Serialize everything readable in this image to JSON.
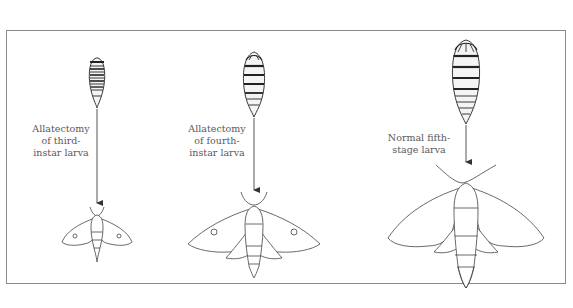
{
  "figure": {
    "clipped_caption": "",
    "panels": [
      {
        "id": "third-instar",
        "label_lines": [
          "Allatectomy",
          "of third-",
          "instar larva"
        ],
        "larva_size": "small",
        "moth_size": "small"
      },
      {
        "id": "fourth-instar",
        "label_lines": [
          "Allatectomy",
          "of fourth-",
          "instar larva"
        ],
        "larva_size": "medium",
        "moth_size": "medium"
      },
      {
        "id": "normal-fifth",
        "label_lines": [
          "Normal fifth-",
          "stage larva"
        ],
        "larva_size": "large",
        "moth_size": "large"
      }
    ],
    "colors": {
      "ink": "#3a3a3a",
      "frame": "#8a8a8a",
      "text": "#5a5a5a"
    }
  }
}
